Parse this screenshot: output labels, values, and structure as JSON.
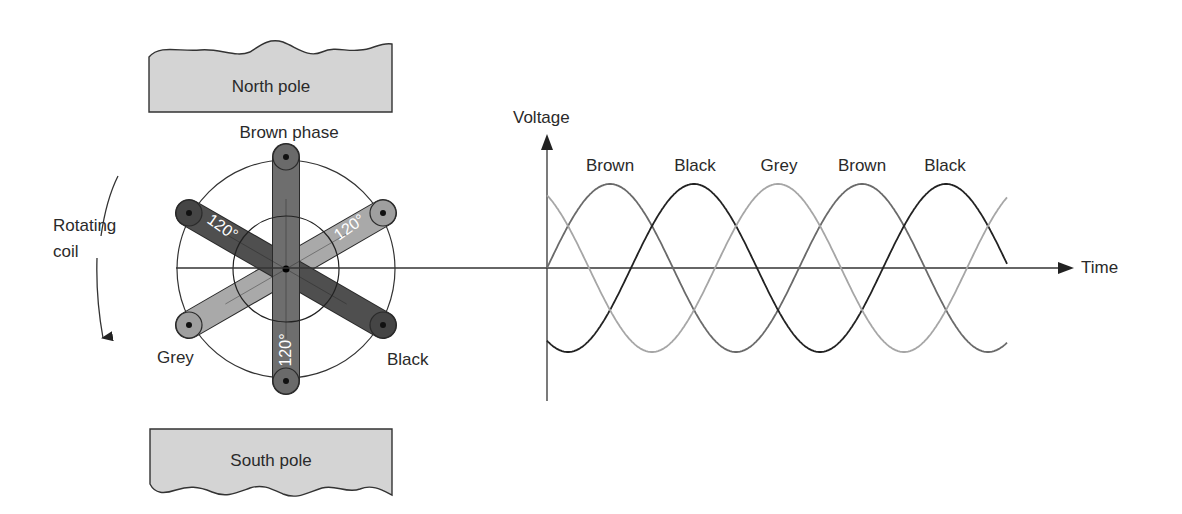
{
  "generator": {
    "north_pole_label": "North pole",
    "south_pole_label": "South pole",
    "rotation_label_line1": "Rotating",
    "rotation_label_line2": "coil",
    "phases": [
      {
        "name": "Brown",
        "label": "Brown phase",
        "color": "#6e6e6e",
        "angle_deg": 90
      },
      {
        "name": "Black",
        "label": "Black",
        "color": "#4a4a4a",
        "angle_deg": -30
      },
      {
        "name": "Grey",
        "label": "Grey",
        "color": "#a8a8a8",
        "angle_deg": 210
      }
    ],
    "angle_labels": [
      "120°",
      "120°",
      "120°"
    ]
  },
  "colors": {
    "pole_fill": "#d4d4d4",
    "brown_wave": "#6a6a6a",
    "black_wave": "#222222",
    "grey_wave": "#a6a6a6",
    "axis": "#333333"
  },
  "chart_data": {
    "type": "line",
    "title": "",
    "xlabel": "Time",
    "ylabel": "Voltage",
    "grid": false,
    "x_range_cycles": [
      0,
      1.83
    ],
    "series": [
      {
        "name": "Brown",
        "phase_deg": 0,
        "amplitude": 1,
        "color": "#6a6a6a"
      },
      {
        "name": "Black",
        "phase_deg": -120,
        "amplitude": 1,
        "color": "#222222"
      },
      {
        "name": "Grey",
        "phase_deg": 120,
        "amplitude": 1,
        "color": "#a6a6a6"
      }
    ],
    "peak_labels": [
      "Brown",
      "Black",
      "Grey",
      "Brown",
      "Black"
    ]
  }
}
